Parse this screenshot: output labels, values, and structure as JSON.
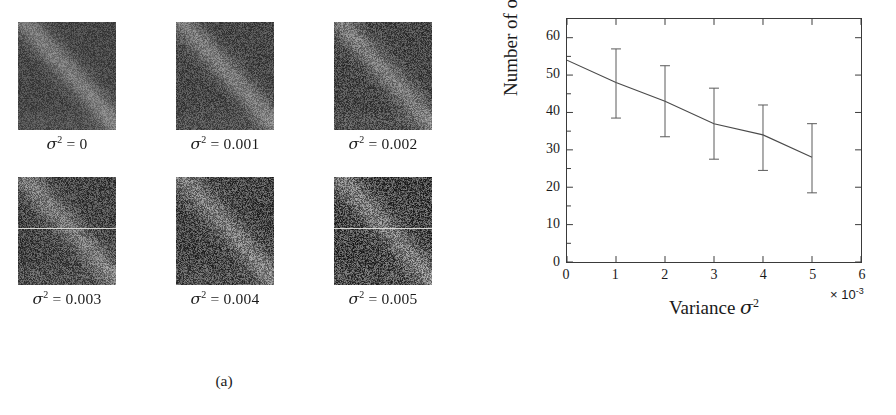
{
  "figure": {
    "panels": [
      {
        "id": "a",
        "caption": "(a)"
      },
      {
        "id": "b",
        "caption": "(b)"
      }
    ]
  },
  "panel_a": {
    "caption": "(a)",
    "tiles": [
      {
        "label_prefix": "σ",
        "label_sup": "2",
        "label_suffix": " = 0",
        "sigma2": 0,
        "noise_variance": 0.0
      },
      {
        "label_prefix": "σ",
        "label_sup": "2",
        "label_suffix": " = 0.001",
        "sigma2": 0.001,
        "noise_variance": 0.001
      },
      {
        "label_prefix": "σ",
        "label_sup": "2",
        "label_suffix": " = 0.002",
        "sigma2": 0.002,
        "noise_variance": 0.002
      },
      {
        "label_prefix": "σ",
        "label_sup": "2",
        "label_suffix": " = 0.003",
        "sigma2": 0.003,
        "noise_variance": 0.003
      },
      {
        "label_prefix": "σ",
        "label_sup": "2",
        "label_suffix": " = 0.004",
        "sigma2": 0.004,
        "noise_variance": 0.004
      },
      {
        "label_prefix": "σ",
        "label_sup": "2",
        "label_suffix": " = 0.005",
        "sigma2": 0.005,
        "noise_variance": 0.005
      }
    ]
  },
  "panel_b": {
    "caption": "(b)",
    "xlabel_prefix": "Variance ",
    "xlabel_sigma": "σ",
    "xlabel_sup": "2",
    "ylabel": "Number of objects",
    "x_multiplier_prefix": "× 10",
    "x_multiplier_sup": "-3"
  },
  "chart_data": {
    "type": "line",
    "title": "",
    "xlabel": "Variance σ²",
    "ylabel": "Number of objects",
    "x_multiplier": "× 10⁻³",
    "x": [
      0,
      1,
      2,
      3,
      4,
      5
    ],
    "values": [
      54,
      48,
      43,
      37,
      34,
      28
    ],
    "error_upper": [
      0,
      9,
      9.5,
      9.5,
      8,
      9
    ],
    "error_lower": [
      0,
      9.5,
      9.5,
      9.5,
      9.5,
      9.5
    ],
    "xlim": [
      0,
      6
    ],
    "ylim": [
      0,
      65
    ],
    "xticks": [
      0,
      1,
      2,
      3,
      4,
      5,
      6
    ],
    "xtick_labels": [
      "0",
      "1",
      "2",
      "3",
      "4",
      "5",
      "6"
    ],
    "yticks": [
      0,
      10,
      20,
      30,
      40,
      50,
      60
    ],
    "ytick_labels": [
      "0",
      "10",
      "20",
      "30",
      "40",
      "50",
      "60"
    ],
    "grid": false,
    "legend": null,
    "line_color": "#4a4a4a",
    "errorbar_color": "#5a5a5a",
    "axis_color": "#3a3a3a"
  }
}
